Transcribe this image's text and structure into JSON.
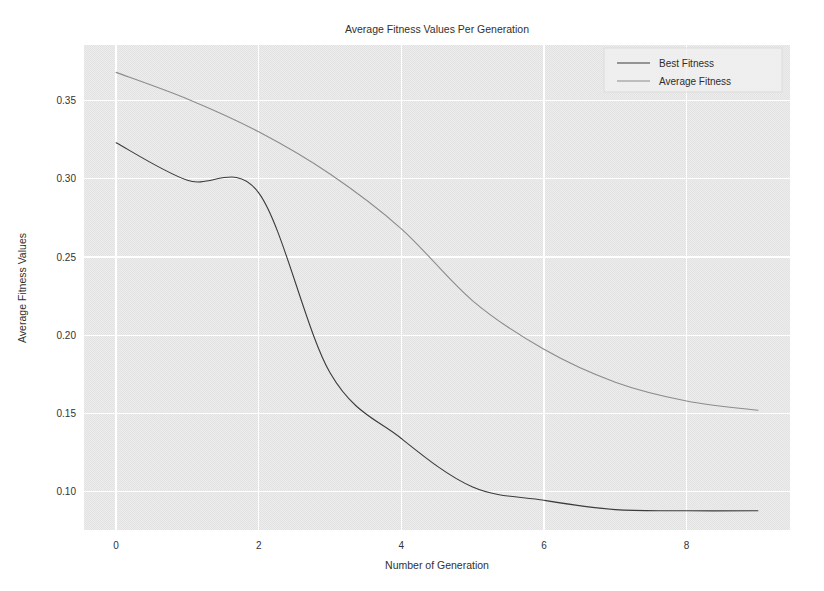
{
  "figure": {
    "width": 824,
    "height": 591,
    "background_color": "#ffffff",
    "plot_background_color": "#eaeaea",
    "grid_color": "#ffffff"
  },
  "chart_data": {
    "type": "line",
    "title": "Average Fitness Values Per Generation",
    "xlabel": "Number of Generation",
    "ylabel": "Average Fitness Values",
    "xlim": [
      -0.45,
      9.45
    ],
    "ylim": [
      0.0755,
      0.3855
    ],
    "xticks": [
      0,
      2,
      4,
      6,
      8
    ],
    "xtick_labels": [
      "0",
      "2",
      "4",
      "6",
      "8"
    ],
    "yticks": [
      0.1,
      0.15,
      0.2,
      0.25,
      0.3,
      0.35
    ],
    "ytick_labels": [
      "0.10",
      "0.15",
      "0.20",
      "0.25",
      "0.30",
      "0.35"
    ],
    "grid": true,
    "legend_position": "upper right",
    "x": [
      0,
      1,
      2,
      3,
      4,
      5,
      6,
      7,
      8,
      9
    ],
    "series": [
      {
        "name": "Best Fitness",
        "color": "#3b3b3b",
        "linestyle": "solid",
        "values": [
          0.323,
          0.299,
          0.291,
          0.176,
          0.134,
          0.103,
          0.0945,
          0.0885,
          0.0878,
          0.0878
        ]
      },
      {
        "name": "Average Fitness",
        "color": "#8c8c8c",
        "linestyle": "solid",
        "values": [
          0.368,
          0.351,
          0.33,
          0.303,
          0.268,
          0.222,
          0.191,
          0.17,
          0.158,
          0.152
        ]
      }
    ]
  },
  "legend": {
    "entries": [
      {
        "label": "Best Fitness",
        "color": "#3b3b3b"
      },
      {
        "label": "Average Fitness",
        "color": "#8c8c8c"
      }
    ]
  }
}
